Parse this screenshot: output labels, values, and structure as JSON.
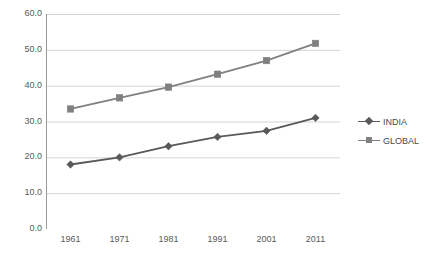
{
  "chart_data": {
    "type": "line",
    "title": "",
    "xlabel": "",
    "ylabel": "",
    "categories": [
      "1961",
      "1971",
      "1981",
      "1991",
      "2001",
      "2011"
    ],
    "x": [
      1961,
      1971,
      1981,
      1991,
      2001,
      2011
    ],
    "series": [
      {
        "name": "INDIA",
        "marker": "diamond",
        "color": "#595959",
        "values": [
          18.0,
          20.0,
          23.1,
          25.7,
          27.4,
          31.0
        ]
      },
      {
        "name": "GLOBAL",
        "marker": "square",
        "color": "#808080",
        "values": [
          33.5,
          36.6,
          39.6,
          43.2,
          47.0,
          51.8
        ]
      }
    ],
    "ylim": [
      0.0,
      60.0
    ],
    "yticks": [
      0.0,
      10.0,
      20.0,
      30.0,
      40.0,
      50.0,
      60.0
    ],
    "ytick_labels": [
      "0.0",
      "10.0",
      "20.0",
      "30.0",
      "40.0",
      "50.0",
      "60.0"
    ],
    "xtick_labels": [
      "1961",
      "1971",
      "1981",
      "1991",
      "2001",
      "2011"
    ],
    "grid": "horizontal",
    "legend_position": "right",
    "legend_entries": [
      "INDIA",
      "GLOBAL"
    ],
    "colors": {
      "india": "#595959",
      "global": "#808080",
      "gridline": "#d4d4d4",
      "axis": "#9a9a9a",
      "background": "#ffffff",
      "text": "#595959"
    }
  }
}
